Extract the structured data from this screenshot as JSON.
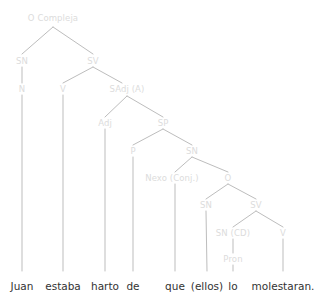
{
  "diagram": {
    "title": "O Compleja",
    "type": "syntax-tree",
    "sentence": "Juan estaba harto de que (ellos) lo molestaran.",
    "colors": {
      "background": "#ffffff",
      "node_label": "#dcdcdc",
      "branch_line": "#bdbdbd",
      "leaf_text": "#333333"
    },
    "nodes": [
      {
        "id": "o-compleja",
        "label": "O Compleja",
        "x": 53,
        "y": 18
      },
      {
        "id": "sn-subject",
        "label": "SN",
        "x": 22,
        "y": 61
      },
      {
        "id": "sv-main",
        "label": "SV",
        "x": 93,
        "y": 61
      },
      {
        "id": "n-juan",
        "label": "N",
        "x": 22,
        "y": 89
      },
      {
        "id": "v-estaba",
        "label": "V",
        "x": 63,
        "y": 89
      },
      {
        "id": "sadj-a",
        "label": "SAdj (A)",
        "x": 127,
        "y": 89
      },
      {
        "id": "adj-harto",
        "label": "Adj",
        "x": 105,
        "y": 123
      },
      {
        "id": "sp",
        "label": "SP",
        "x": 163,
        "y": 123
      },
      {
        "id": "p-de",
        "label": "P",
        "x": 133,
        "y": 151
      },
      {
        "id": "sn-subordinate",
        "label": "SN",
        "x": 192,
        "y": 151
      },
      {
        "id": "nexo-conj",
        "label": "Nexo (Conj.)",
        "x": 172,
        "y": 178
      },
      {
        "id": "o-subordinate",
        "label": "O",
        "x": 228,
        "y": 178
      },
      {
        "id": "sn-ellos",
        "label": "SN",
        "x": 206,
        "y": 205
      },
      {
        "id": "sv-subordinate",
        "label": "SV",
        "x": 256,
        "y": 205
      },
      {
        "id": "sn-cd",
        "label": "SN (CD)",
        "x": 233,
        "y": 233
      },
      {
        "id": "v-molestaran",
        "label": "V",
        "x": 283,
        "y": 233
      },
      {
        "id": "pron-lo",
        "label": "Pron",
        "x": 233,
        "y": 259
      }
    ],
    "leaves": [
      {
        "id": "leaf-juan",
        "label": "Juan",
        "x": 22,
        "y": 281
      },
      {
        "id": "leaf-estaba",
        "label": "estaba",
        "x": 63,
        "y": 281
      },
      {
        "id": "leaf-harto",
        "label": "harto",
        "x": 105,
        "y": 281
      },
      {
        "id": "leaf-de",
        "label": "de",
        "x": 133,
        "y": 281
      },
      {
        "id": "leaf-que",
        "label": "que",
        "x": 175,
        "y": 281
      },
      {
        "id": "leaf-ellos",
        "label": "(ellos)",
        "x": 207,
        "y": 281
      },
      {
        "id": "leaf-lo",
        "label": "lo",
        "x": 233,
        "y": 281
      },
      {
        "id": "leaf-molestaran",
        "label": "molestaran.",
        "x": 283,
        "y": 281
      }
    ],
    "edges": [
      {
        "from": "o-compleja",
        "to": "sn-subject",
        "x1": 53,
        "y1": 27,
        "x2": 22,
        "y2": 54
      },
      {
        "from": "o-compleja",
        "to": "sv-main",
        "x1": 53,
        "y1": 27,
        "x2": 93,
        "y2": 54
      },
      {
        "from": "sn-subject",
        "to": "n-juan",
        "x1": 22,
        "y1": 67,
        "x2": 22,
        "y2": 83
      },
      {
        "from": "sv-main",
        "to": "v-estaba",
        "x1": 93,
        "y1": 67,
        "x2": 63,
        "y2": 83
      },
      {
        "from": "sv-main",
        "to": "sadj-a",
        "x1": 93,
        "y1": 67,
        "x2": 122,
        "y2": 83
      },
      {
        "from": "sadj-a",
        "to": "adj-harto",
        "x1": 127,
        "y1": 96,
        "x2": 105,
        "y2": 117
      },
      {
        "from": "sadj-a",
        "to": "sp",
        "x1": 127,
        "y1": 96,
        "x2": 163,
        "y2": 117
      },
      {
        "from": "sp",
        "to": "p-de",
        "x1": 163,
        "y1": 129,
        "x2": 133,
        "y2": 145
      },
      {
        "from": "sp",
        "to": "sn-subordinate",
        "x1": 163,
        "y1": 129,
        "x2": 192,
        "y2": 145
      },
      {
        "from": "sn-subordinate",
        "to": "nexo-conj",
        "x1": 192,
        "y1": 157,
        "x2": 175,
        "y2": 172
      },
      {
        "from": "sn-subordinate",
        "to": "o-subordinate",
        "x1": 192,
        "y1": 157,
        "x2": 228,
        "y2": 172
      },
      {
        "from": "o-subordinate",
        "to": "sn-ellos",
        "x1": 228,
        "y1": 184,
        "x2": 206,
        "y2": 199
      },
      {
        "from": "o-subordinate",
        "to": "sv-subordinate",
        "x1": 228,
        "y1": 184,
        "x2": 256,
        "y2": 199
      },
      {
        "from": "sv-subordinate",
        "to": "sn-cd",
        "x1": 256,
        "y1": 211,
        "x2": 233,
        "y2": 227
      },
      {
        "from": "sv-subordinate",
        "to": "v-molestaran",
        "x1": 256,
        "y1": 211,
        "x2": 283,
        "y2": 227
      },
      {
        "from": "sn-cd",
        "to": "pron-lo",
        "x1": 233,
        "y1": 239,
        "x2": 233,
        "y2": 253
      },
      {
        "from": "n-juan",
        "to": "leaf-juan",
        "x1": 22,
        "y1": 95,
        "x2": 22,
        "y2": 271
      },
      {
        "from": "v-estaba",
        "to": "leaf-estaba",
        "x1": 63,
        "y1": 95,
        "x2": 63,
        "y2": 271
      },
      {
        "from": "adj-harto",
        "to": "leaf-harto",
        "x1": 105,
        "y1": 129,
        "x2": 105,
        "y2": 271
      },
      {
        "from": "p-de",
        "to": "leaf-de",
        "x1": 133,
        "y1": 157,
        "x2": 133,
        "y2": 271
      },
      {
        "from": "nexo-conj",
        "to": "leaf-que",
        "x1": 175,
        "y1": 184,
        "x2": 175,
        "y2": 271
      },
      {
        "from": "sn-ellos",
        "to": "leaf-ellos",
        "x1": 206,
        "y1": 211,
        "x2": 207,
        "y2": 271
      },
      {
        "from": "pron-lo",
        "to": "leaf-lo",
        "x1": 233,
        "y1": 265,
        "x2": 233,
        "y2": 271
      },
      {
        "from": "v-molestaran",
        "to": "leaf-molestaran",
        "x1": 283,
        "y1": 239,
        "x2": 283,
        "y2": 271
      }
    ]
  }
}
